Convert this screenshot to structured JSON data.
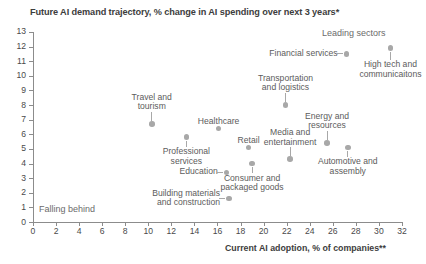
{
  "chart_data": {
    "type": "scatter",
    "title": "Future AI demand trajectory, % change in AI spending over next 3 years*",
    "xlabel": "Current AI adoption, % of companies**",
    "ylabel": "",
    "xlim": [
      0,
      32
    ],
    "ylim": [
      0,
      13
    ],
    "xticks": [
      0,
      2,
      4,
      6,
      8,
      10,
      12,
      14,
      16,
      18,
      20,
      22,
      24,
      26,
      28,
      30,
      32
    ],
    "yticks": [
      0,
      1,
      2,
      3,
      4,
      5,
      6,
      7,
      8,
      9,
      10,
      11,
      12,
      13
    ],
    "grid": false,
    "legend": "none",
    "annotations": [
      {
        "text": "Leading sectors",
        "x": 25.2,
        "y": 13.0
      },
      {
        "text": "Falling behind",
        "x": 0.6,
        "y": 1.2
      }
    ],
    "points": [
      {
        "label": "Financial services",
        "x": 27.2,
        "y": 11.5
      },
      {
        "label": "High tech and\ncommunicaitons",
        "x": 31.0,
        "y": 11.9
      },
      {
        "label": "Transportation\nand logistics",
        "x": 21.9,
        "y": 8.0
      },
      {
        "label": "Travel and\ntourism",
        "x": 10.3,
        "y": 6.7
      },
      {
        "label": "Healthcare",
        "x": 16.1,
        "y": 6.4
      },
      {
        "label": "Professional\nservices",
        "x": 13.3,
        "y": 5.8
      },
      {
        "label": "Energy and\nresources",
        "x": 25.5,
        "y": 5.4
      },
      {
        "label": "Retail",
        "x": 18.7,
        "y": 5.1
      },
      {
        "label": "Automotive and\nassembly",
        "x": 27.3,
        "y": 5.1
      },
      {
        "label": "Media and\nentertainment",
        "x": 22.3,
        "y": 4.3
      },
      {
        "label": "Consumer and\npackaged goods",
        "x": 19.0,
        "y": 4.0
      },
      {
        "label": "Education",
        "x": 16.8,
        "y": 3.4
      },
      {
        "label": "Building materials\nand construction",
        "x": 17.0,
        "y": 1.6
      }
    ]
  },
  "labels": {
    "financial_services": "Financial services",
    "high_tech_1": "High tech and",
    "high_tech_2": "communicaitons",
    "transportation_1": "Transportation",
    "transportation_2": "and logistics",
    "travel_1": "Travel and",
    "travel_2": "tourism",
    "healthcare": "Healthcare",
    "professional_1": "Professional",
    "professional_2": "services",
    "energy_1": "Energy and",
    "energy_2": "resources",
    "retail": "Retail",
    "automotive_1": "Automotive and",
    "automotive_2": "assembly",
    "media_1": "Media and",
    "media_2": "entertainment",
    "consumer_1": "Consumer and",
    "consumer_2": "packaged goods",
    "education": "Education",
    "building_1": "Building materials",
    "building_2": "and construction",
    "leading_sectors": "Leading sectors",
    "falling_behind": "Falling behind"
  },
  "style": {
    "marker_color": "#a8a8a8",
    "axis_color": "#8c8c8c",
    "text_color": "#5c5c5c",
    "title_color": "#3d3d3d",
    "background": "#ffffff"
  }
}
